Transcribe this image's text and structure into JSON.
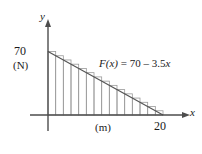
{
  "figure": {
    "title": "",
    "axis_labels": {
      "x_axis_name": "x",
      "y_axis_name": "y"
    },
    "annotations": {
      "y_intercept_value": "70",
      "y_unit": "(N)",
      "x_unit": "(m)",
      "x_end_value": "20",
      "equation_lead": "F",
      "equation_var": "(x)",
      "equation_rhs": " = 70 – 3.5",
      "equation_tail": "x",
      "equation_full": "F(x) = 70 – 3.5x"
    },
    "colors": {
      "axis": "#4d4d4d",
      "curve": "#555555",
      "rectangle_stroke": "#9a9a9a",
      "text": "#1a1a1a",
      "background": "#ffffff"
    }
  },
  "chart_data": {
    "type": "area",
    "title": "",
    "subtitle": "",
    "xlabel": "(m)",
    "ylabel": "(N)",
    "xlim": [
      0,
      20
    ],
    "ylim": [
      0,
      70
    ],
    "grid": false,
    "legend": null,
    "function": {
      "expression": "F(x) = 70 - 3.5x",
      "intercept": 70,
      "slope": -3.5,
      "x_root": 20
    },
    "x": [
      0,
      20
    ],
    "values": [
      70,
      0
    ],
    "annotations": [
      {
        "text": "70",
        "x": 0,
        "y": 70
      },
      {
        "text": "(N)",
        "x": 0,
        "y": 60
      },
      {
        "text": "20",
        "x": 20,
        "y": 0
      },
      {
        "text": "(m)",
        "x": 11,
        "y": 0
      },
      {
        "text": "F(x) = 70 - 3.5x",
        "x": 10,
        "y": 52
      }
    ],
    "riemann_rectangles": {
      "count": 15,
      "rule": "left-endpoint",
      "dx": 1.3333,
      "x_left_edges": [
        0,
        1.3333,
        2.6667,
        4,
        5.3333,
        6.6667,
        8,
        9.3333,
        10.6667,
        12,
        13.3333,
        14.6667,
        16,
        17.3333,
        18.6667
      ],
      "heights": [
        70,
        65.33,
        60.67,
        56,
        51.33,
        46.67,
        42,
        37.33,
        32.67,
        28,
        23.33,
        18.67,
        14,
        9.33,
        4.67
      ]
    }
  }
}
